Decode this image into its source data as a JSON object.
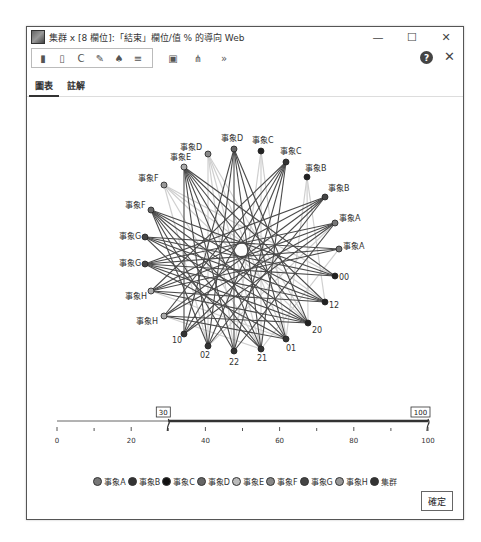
{
  "window": {
    "title": "集群 x [8 欄位]:「結束」欄位/值 % 的導向 Web",
    "controls": {
      "minimize": "—",
      "maximize": "☐",
      "close": "✕"
    }
  },
  "toolbar": {
    "icons": [
      "clipboard-icon",
      "copy-icon",
      "undo-icon",
      "brush-icon",
      "paint-icon",
      "menu-icon"
    ],
    "extra_icons": [
      "export-icon",
      "layout-icon",
      "more-icon"
    ],
    "more_label": "»",
    "help_label": "?",
    "close_label": "✕"
  },
  "tabs": [
    {
      "label": "圖表",
      "active": true
    },
    {
      "label": "註解",
      "active": false
    }
  ],
  "graph": {
    "nodes": [
      {
        "label": "事象D",
        "x": 207,
        "y": 99,
        "fill": "#888",
        "lx": -28,
        "ly": -4
      },
      {
        "label": "事象D",
        "x": 233,
        "y": 94,
        "fill": "#666",
        "lx": -13,
        "ly": -8
      },
      {
        "label": "事象C",
        "x": 260,
        "y": 96,
        "fill": "#222",
        "lx": -9,
        "ly": -8
      },
      {
        "label": "事象C",
        "x": 285,
        "y": 107,
        "fill": "#333",
        "lx": -6,
        "ly": -8
      },
      {
        "label": "事象B",
        "x": 306,
        "y": 122,
        "fill": "#222",
        "lx": -2,
        "ly": -6
      },
      {
        "label": "事象B",
        "x": 324,
        "y": 142,
        "fill": "#444",
        "lx": 3,
        "ly": -6
      },
      {
        "label": "事象A",
        "x": 334,
        "y": 168,
        "fill": "#777",
        "lx": 4,
        "ly": -2
      },
      {
        "label": "事象A",
        "x": 338,
        "y": 194,
        "fill": "#777",
        "lx": 4,
        "ly": 0
      },
      {
        "label": "00",
        "x": 334,
        "y": 221,
        "fill": "#222",
        "lx": 4,
        "ly": 4
      },
      {
        "label": "12",
        "x": 324,
        "y": 247,
        "fill": "#222",
        "lx": 4,
        "ly": 6
      },
      {
        "label": "20",
        "x": 307,
        "y": 268,
        "fill": "#222",
        "lx": 4,
        "ly": 10
      },
      {
        "label": "01",
        "x": 285,
        "y": 284,
        "fill": "#333",
        "lx": 0,
        "ly": 12
      },
      {
        "label": "21",
        "x": 260,
        "y": 294,
        "fill": "#333",
        "lx": -4,
        "ly": 12
      },
      {
        "label": "22",
        "x": 233,
        "y": 296,
        "fill": "#333",
        "lx": -5,
        "ly": 14
      },
      {
        "label": "02",
        "x": 207,
        "y": 291,
        "fill": "#333",
        "lx": -8,
        "ly": 12
      },
      {
        "label": "10",
        "x": 183,
        "y": 279,
        "fill": "#333",
        "lx": -12,
        "ly": 9
      },
      {
        "label": "事象H",
        "x": 163,
        "y": 261,
        "fill": "#aaa",
        "lx": -28,
        "ly": 8
      },
      {
        "label": "事象H",
        "x": 150,
        "y": 236,
        "fill": "#aaa",
        "lx": -26,
        "ly": 8
      },
      {
        "label": "事象G",
        "x": 144,
        "y": 209,
        "fill": "#444",
        "lx": -26,
        "ly": 2
      },
      {
        "label": "事象G",
        "x": 144,
        "y": 182,
        "fill": "#444",
        "lx": -26,
        "ly": 2
      },
      {
        "label": "事象F",
        "x": 150,
        "y": 155,
        "fill": "#666",
        "lx": -26,
        "ly": -2
      },
      {
        "label": "事象F",
        "x": 163,
        "y": 130,
        "fill": "#999",
        "lx": -26,
        "ly": -4
      },
      {
        "label": "事象E",
        "x": 183,
        "y": 112,
        "fill": "#aaa",
        "lx": -14,
        "ly": -7
      }
    ],
    "strong_edges": [
      [
        1,
        14
      ],
      [
        1,
        13
      ],
      [
        1,
        12
      ],
      [
        1,
        15
      ],
      [
        1,
        11
      ],
      [
        1,
        10
      ],
      [
        3,
        15
      ],
      [
        3,
        14
      ],
      [
        3,
        16
      ],
      [
        3,
        13
      ],
      [
        3,
        17
      ],
      [
        3,
        12
      ],
      [
        5,
        15
      ],
      [
        5,
        16
      ],
      [
        5,
        17
      ],
      [
        5,
        14
      ],
      [
        5,
        18
      ],
      [
        6,
        16
      ],
      [
        6,
        17
      ],
      [
        6,
        18
      ],
      [
        6,
        15
      ],
      [
        6,
        13
      ],
      [
        7,
        18
      ],
      [
        7,
        19
      ],
      [
        7,
        17
      ],
      [
        18,
        8
      ],
      [
        18,
        9
      ],
      [
        18,
        10
      ],
      [
        18,
        11
      ],
      [
        19,
        8
      ],
      [
        19,
        9
      ],
      [
        19,
        10
      ],
      [
        19,
        12
      ],
      [
        20,
        8
      ],
      [
        20,
        9
      ],
      [
        20,
        10
      ],
      [
        20,
        11
      ],
      [
        20,
        12
      ],
      [
        20,
        13
      ],
      [
        20,
        14
      ],
      [
        22,
        8
      ],
      [
        22,
        9
      ],
      [
        22,
        10
      ],
      [
        22,
        11
      ],
      [
        22,
        12
      ],
      [
        22,
        13
      ],
      [
        22,
        14
      ],
      [
        22,
        15
      ],
      [
        17,
        9
      ],
      [
        17,
        10
      ],
      [
        16,
        10
      ],
      [
        16,
        11
      ]
    ],
    "weak_edges": [
      [
        0,
        13
      ],
      [
        0,
        12
      ],
      [
        0,
        11
      ],
      [
        0,
        14
      ],
      [
        2,
        12
      ],
      [
        2,
        11
      ],
      [
        4,
        10
      ],
      [
        4,
        9
      ],
      [
        21,
        8
      ],
      [
        21,
        9
      ],
      [
        21,
        12
      ],
      [
        21,
        14
      ],
      [
        16,
        12
      ],
      [
        17,
        11
      ],
      [
        6,
        14
      ],
      [
        7,
        12
      ],
      [
        0,
        10
      ],
      [
        2,
        13
      ],
      [
        4,
        11
      ],
      [
        21,
        10
      ]
    ]
  },
  "legend": [
    {
      "label": "事象A",
      "color": "#777777"
    },
    {
      "label": "事象B",
      "color": "#333333"
    },
    {
      "label": "事象C",
      "color": "#111111"
    },
    {
      "label": "事象D",
      "color": "#666666"
    },
    {
      "label": "事象E",
      "color": "#bbbbbb"
    },
    {
      "label": "事象F",
      "color": "#888888"
    },
    {
      "label": "事象G",
      "color": "#444444"
    },
    {
      "label": "事象H",
      "color": "#999999"
    },
    {
      "label": "集群",
      "color": "#333333"
    }
  ],
  "slider": {
    "min": 0,
    "max": 100,
    "low_value": "30",
    "high_value": "100",
    "ticks": [
      "0",
      "20",
      "40",
      "60",
      "80",
      "100"
    ]
  },
  "footer": {
    "ok_label": "確定"
  }
}
